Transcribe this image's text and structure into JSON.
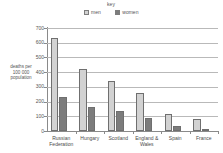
{
  "legend": {
    "title": "key",
    "items": [
      {
        "label": "men",
        "color": "#d2d2d2",
        "swatch": "men-swatch"
      },
      {
        "label": "women",
        "color": "#7c7c7c",
        "swatch": "women-swatch"
      }
    ]
  },
  "axes": {
    "y_title_line1": "deaths per",
    "y_title_line2": "100 000",
    "y_title_line3": "population",
    "y_ticks": [
      "0",
      "100",
      "200",
      "300",
      "400",
      "500",
      "600",
      "700"
    ]
  },
  "chart_data": {
    "type": "bar",
    "title": "",
    "subtitle": "",
    "xlabel": "",
    "ylabel": "deaths per 100 000 population",
    "ylim": [
      0,
      700
    ],
    "ytick_step": 100,
    "grid": true,
    "legend_position": "top-center",
    "categories": [
      "Russian Federation",
      "Hungary",
      "Scotland",
      "England & Wales",
      "Spain",
      "France"
    ],
    "category_lines": [
      [
        "Russian",
        "Federation"
      ],
      [
        "Hungary"
      ],
      [
        "Scotland"
      ],
      [
        "England &",
        "Wales"
      ],
      [
        "Spain"
      ],
      [
        "France"
      ]
    ],
    "series": [
      {
        "name": "men",
        "color": "#d2d2d2",
        "values": [
          630,
          420,
          338,
          258,
          118,
          85
        ]
      },
      {
        "name": "women",
        "color": "#7c7c7c",
        "values": [
          228,
          160,
          138,
          90,
          32,
          15
        ]
      }
    ]
  }
}
